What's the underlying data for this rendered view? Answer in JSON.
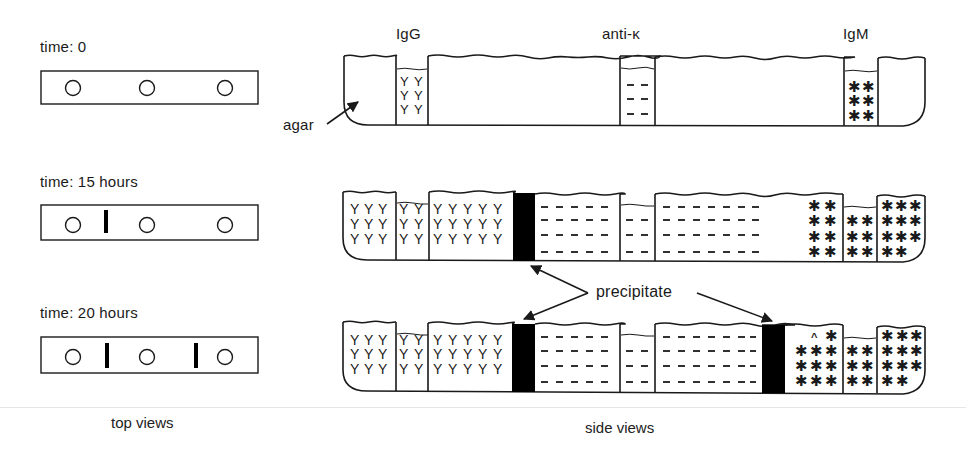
{
  "figure": {
    "captions": {
      "top_views": "top views",
      "side_views": "side views"
    },
    "colors": {
      "ink": "#1a1a1a",
      "background": "#ffffff",
      "precipitate": "#000000"
    }
  },
  "top_views": [
    {
      "time_label": "time: 0",
      "wells": 3,
      "precipitate_bands": 0
    },
    {
      "time_label": "time: 15 hours",
      "wells": 3,
      "precipitate_bands": 1
    },
    {
      "time_label": "time: 20 hours",
      "wells": 3,
      "precipitate_bands": 2
    }
  ],
  "side_views": {
    "well_labels": {
      "left": "IgG",
      "center": "anti-κ",
      "right": "IgM"
    },
    "agar_label": "agar",
    "precipitate_label": "precipitate",
    "symbols": {
      "IgG": "Y",
      "anti_kappa": "–",
      "IgM": "✱"
    },
    "panels": [
      {
        "time": "0",
        "precipitate_bands": 0
      },
      {
        "time": "15 hours",
        "precipitate_bands": 1
      },
      {
        "time": "20 hours",
        "precipitate_bands": 2
      }
    ]
  }
}
